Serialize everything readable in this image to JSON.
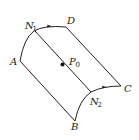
{
  "diagram": {
    "type": "surface-patch",
    "points": {
      "A": {
        "label": "A",
        "sub": ""
      },
      "B": {
        "label": "B",
        "sub": ""
      },
      "C": {
        "label": "C",
        "sub": ""
      },
      "D": {
        "label": "D",
        "sub": ""
      },
      "N1": {
        "label": "N",
        "sub": "1"
      },
      "N2": {
        "label": "N",
        "sub": "2"
      },
      "P0": {
        "label": "P",
        "sub": "0"
      }
    },
    "edges": [
      {
        "from": "A",
        "to": "D",
        "kind": "arc",
        "arrow_at": "mid",
        "via": "N1"
      },
      {
        "from": "B",
        "to": "C",
        "kind": "arc",
        "arrow_at": "mid",
        "via": "N2"
      },
      {
        "from": "A",
        "to": "B",
        "kind": "line"
      },
      {
        "from": "D",
        "to": "C",
        "kind": "line"
      },
      {
        "from": "N1",
        "to": "N2",
        "kind": "line",
        "through": "P0"
      }
    ],
    "colors": {
      "stroke": "#222222",
      "background": "#ffffff"
    }
  }
}
